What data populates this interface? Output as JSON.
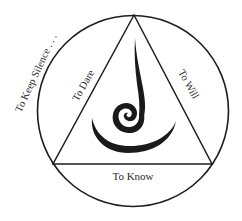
{
  "diagram": {
    "labels": {
      "outer": "To Keep Silence . . .",
      "left_side": "To Dare",
      "right_side": "To Will",
      "base": "To Know"
    },
    "elements": {
      "outer_shape": "circle",
      "inner_shape": "triangle",
      "center_symbol": "spiral-flame"
    },
    "colors": {
      "stroke": "#1e1e1e",
      "text": "#2a2a2a",
      "background": "#ffffff"
    }
  }
}
